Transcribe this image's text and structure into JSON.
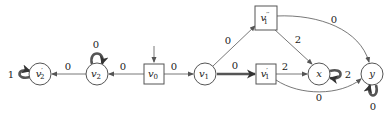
{
  "diagram": {
    "type": "game-graph",
    "nodes": [
      {
        "id": "v2p",
        "label": "v",
        "sub": "2",
        "prime": "′",
        "shape": "circle",
        "x": 40,
        "y": 74
      },
      {
        "id": "v2",
        "label": "v",
        "sub": "2",
        "prime": "",
        "shape": "circle",
        "x": 97,
        "y": 74
      },
      {
        "id": "v0",
        "label": "v",
        "sub": "0",
        "prime": "",
        "shape": "square",
        "x": 154,
        "y": 74,
        "initial": true
      },
      {
        "id": "v1",
        "label": "v",
        "sub": "1",
        "prime": "",
        "shape": "circle",
        "x": 205,
        "y": 74
      },
      {
        "id": "v1pp",
        "label": "v",
        "sub": "1",
        "prime": "′′",
        "shape": "square",
        "x": 266,
        "y": 18
      },
      {
        "id": "v1p",
        "label": "v",
        "sub": "1",
        "prime": "′",
        "shape": "square",
        "x": 266,
        "y": 74
      },
      {
        "id": "x",
        "label": "x",
        "sub": "",
        "prime": "",
        "shape": "circle",
        "x": 319,
        "y": 74
      },
      {
        "id": "y",
        "label": "y",
        "sub": "",
        "prime": "",
        "shape": "circle",
        "x": 372,
        "y": 74
      }
    ],
    "edges": [
      {
        "from": "v0",
        "to": "v2",
        "weight": "0"
      },
      {
        "from": "v2",
        "to": "v2p",
        "weight": "0"
      },
      {
        "from": "v2",
        "to": "v2",
        "weight": "0",
        "thick": true
      },
      {
        "from": "v2p",
        "to": "v2p",
        "weight": "1",
        "thick": true
      },
      {
        "from": "v0",
        "to": "v1",
        "weight": "0"
      },
      {
        "from": "v1",
        "to": "v1pp",
        "weight": "0"
      },
      {
        "from": "v1",
        "to": "v1p",
        "weight": "0",
        "thick": true
      },
      {
        "from": "v1pp",
        "to": "x",
        "weight": "2"
      },
      {
        "from": "v1pp",
        "to": "y",
        "weight": "0"
      },
      {
        "from": "v1p",
        "to": "x",
        "weight": "2"
      },
      {
        "from": "v1p",
        "to": "y",
        "weight": "0"
      },
      {
        "from": "x",
        "to": "x",
        "weight": "2",
        "thick": true
      },
      {
        "from": "y",
        "to": "y",
        "weight": "0",
        "thick": true
      }
    ],
    "edge_labels": {
      "v0_v2": "0",
      "v2_v2p": "0",
      "v2_loop": "0",
      "v2p_loop": "1",
      "v0_v1": "0",
      "v1_v1pp": "0",
      "v1_v1p": "0",
      "v1pp_x": "2",
      "v1pp_y": "0",
      "v1p_x": "2",
      "v1p_y": "0",
      "x_loop": "2",
      "y_loop": "0"
    }
  }
}
